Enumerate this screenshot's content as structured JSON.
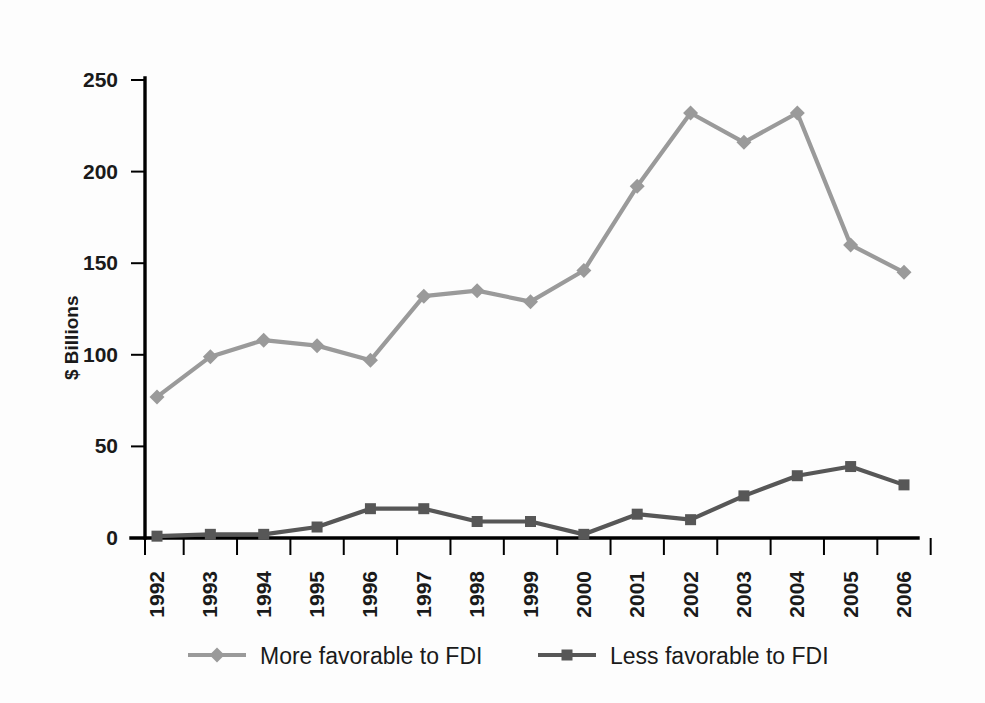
{
  "chart_data": {
    "type": "line",
    "title": "",
    "xlabel": "",
    "ylabel": "$ Billions",
    "categories": [
      "1992",
      "1993",
      "1994",
      "1995",
      "1996",
      "1997",
      "1998",
      "1999",
      "2000",
      "2001",
      "2002",
      "2003",
      "2004",
      "2005",
      "2006"
    ],
    "ylim": [
      0,
      250
    ],
    "yticks": [
      0,
      50,
      100,
      150,
      200,
      250
    ],
    "ytick_labels": [
      "0",
      "50",
      "100",
      "150",
      "200",
      "250"
    ],
    "grid": false,
    "legend_position": "bottom",
    "series": [
      {
        "name": "More favorable to FDI",
        "color": "#9a9a9a",
        "marker": "diamond",
        "values": [
          77,
          99,
          108,
          105,
          97,
          132,
          135,
          129,
          146,
          192,
          232,
          216,
          232,
          160,
          145
        ]
      },
      {
        "name": "Less favorable to FDI",
        "color": "#575757",
        "marker": "square",
        "values": [
          1,
          2,
          2,
          6,
          16,
          16,
          9,
          9,
          2,
          13,
          10,
          23,
          34,
          39,
          29
        ]
      }
    ]
  },
  "legend": {
    "items": [
      {
        "label": "More favorable to FDI",
        "color": "#9a9a9a",
        "marker": "diamond"
      },
      {
        "label": "Less favorable to FDI",
        "color": "#575757",
        "marker": "square"
      }
    ]
  },
  "axes": {
    "y_title": "$ Billions"
  }
}
